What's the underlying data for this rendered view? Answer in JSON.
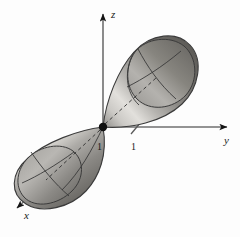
{
  "figure": {
    "background_color": "#fdfdfd",
    "width": 240,
    "height": 237,
    "axes": {
      "z": {
        "label": "z",
        "direction": "up",
        "arrow_tip": [
          103,
          11
        ]
      },
      "y": {
        "label": "y",
        "direction": "right",
        "arrow_tip": [
          231,
          127
        ]
      },
      "x": {
        "label": "x",
        "direction": "down-left",
        "arrow_tip": [
          13,
          211
        ]
      },
      "origin": [
        103,
        127
      ],
      "axis_color": "#6b6b6b",
      "arrow_color": "#1a1a1a"
    },
    "ticks": [
      {
        "name": "tick-x-one",
        "label": "1",
        "label_pos": [
          99,
          146
        ],
        "axis": "x"
      },
      {
        "name": "tick-y-one",
        "label": "1",
        "label_pos": [
          133,
          146
        ],
        "axis": "y"
      }
    ],
    "surfaces": [
      {
        "name": "upper-nappe",
        "description": "teardrop cone opening toward upper right",
        "apex": [
          103,
          127
        ],
        "fill_light": "#d9d7d3",
        "fill_dark": "#565450",
        "outline_color": "#3a3a3a"
      },
      {
        "name": "lower-nappe",
        "description": "teardrop cone opening toward lower left",
        "apex": [
          103,
          127
        ],
        "fill_light": "#d9d7d3",
        "fill_dark": "#565450",
        "outline_color": "#3a3a3a"
      }
    ],
    "origin_dot": {
      "name": "origin-point",
      "center": [
        103,
        127
      ],
      "radius": 4,
      "color": "#111111"
    }
  }
}
